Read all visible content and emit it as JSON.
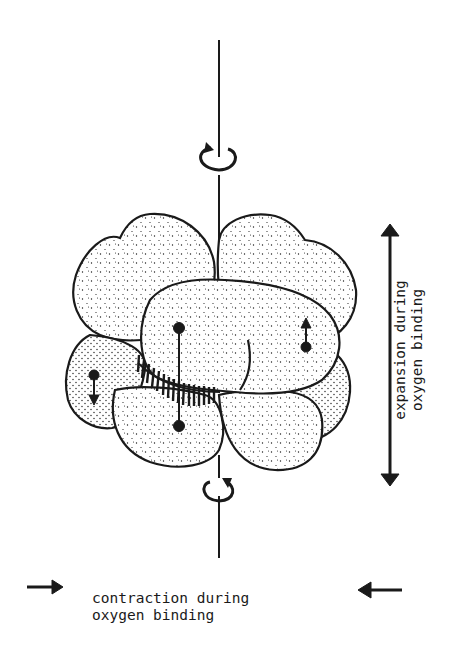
{
  "figure": {
    "labels": {
      "vertical": [
        "expansion during",
        "oxygen binding"
      ],
      "horizontal": [
        "contraction during",
        "oxygen binding"
      ]
    },
    "colors": {
      "ink": "#1a1a1a",
      "background": "#ffffff"
    }
  }
}
